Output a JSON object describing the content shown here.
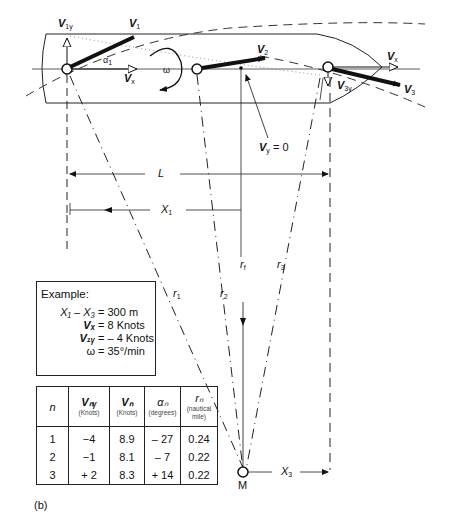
{
  "diagram": {
    "labels": {
      "v1y": "V",
      "v1y_sub": "1y",
      "v1": "V",
      "v1_sub": "1",
      "alpha1": "α",
      "alpha1_sub": "1",
      "omega": "ω",
      "vx_left": "V",
      "vx_left_sub": "x",
      "v2": "V",
      "v2_sub": "2",
      "vx_right": "V",
      "vx_right_sub": "x",
      "v3y": "V",
      "v3y_sub": "3y",
      "v3": "V",
      "v3_sub": "3",
      "vy_zero": "V",
      "vy_zero_sub": "y",
      "vy_zero_value": " = 0",
      "L": "L",
      "X1": "X",
      "X1_sub": "1",
      "rf": "r",
      "rf_sub": "f",
      "r3": "r",
      "r3_sub": "3",
      "r1": "r",
      "r1_sub": "1",
      "r2": "r",
      "r2_sub": "2",
      "M": "M",
      "X3": "X",
      "X3_sub": "3"
    }
  },
  "example": {
    "title": "Example:",
    "rows": [
      {
        "key": "X₁ – X₃",
        "value": "= 300 m"
      },
      {
        "key": "Vₓ",
        "value": "= 8 Knots"
      },
      {
        "key": "V₁ᵧ",
        "value": "= – 4 Knots"
      },
      {
        "key": "ω",
        "value": "= 35°/min"
      }
    ]
  },
  "table": {
    "headers": [
      {
        "main": "n",
        "unit": ""
      },
      {
        "main": "Vₙᵧ",
        "unit": "(Knots)"
      },
      {
        "main": "Vₙ",
        "unit": "(Knots)"
      },
      {
        "main": "αₙ",
        "unit": "(degrees)"
      },
      {
        "main": "rₙ",
        "unit": "(nautical mile)"
      }
    ],
    "rows": [
      [
        "1",
        "−4",
        "8.9",
        "– 27",
        "0.24"
      ],
      [
        "2",
        "−1",
        "8.1",
        "– 7",
        "0.22"
      ],
      [
        "3",
        "+ 2",
        "8.3",
        "+ 14",
        "0.22"
      ]
    ]
  },
  "caption": "(b)"
}
